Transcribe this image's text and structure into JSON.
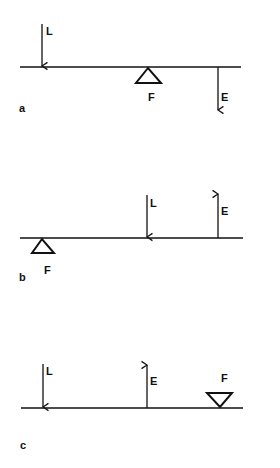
{
  "diagram": {
    "type": "lever-classes",
    "panels": [
      {
        "id": "a",
        "panel_label": "a",
        "load_label": "L",
        "fulcrum_label": "F",
        "effort_label": "E",
        "order_left_to_right": [
          "L",
          "F",
          "E"
        ],
        "load_direction": "down",
        "effort_direction": "down",
        "fulcrum_orientation": "below-beam"
      },
      {
        "id": "b",
        "panel_label": "b",
        "load_label": "L",
        "fulcrum_label": "F",
        "effort_label": "E",
        "order_left_to_right": [
          "F",
          "L",
          "E"
        ],
        "load_direction": "down",
        "effort_direction": "up",
        "fulcrum_orientation": "below-beam"
      },
      {
        "id": "c",
        "panel_label": "c",
        "load_label": "L",
        "fulcrum_label": "F",
        "effort_label": "E",
        "order_left_to_right": [
          "L",
          "E",
          "F"
        ],
        "load_direction": "down",
        "effort_direction": "up",
        "fulcrum_orientation": "above-beam"
      }
    ],
    "colors": {
      "line": "#111111",
      "background": "#ffffff"
    }
  }
}
